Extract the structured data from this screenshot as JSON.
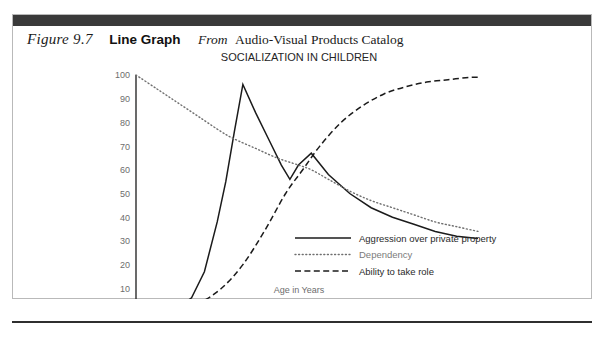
{
  "figure": {
    "number": "Figure 9.7",
    "kind": "Line Graph",
    "from_label": "From",
    "source": "Audio-Visual Products Catalog"
  },
  "chart_data": {
    "type": "line",
    "title": "SOCIALIZATION IN CHILDREN",
    "xlabel": "Age in Years",
    "ylabel": "",
    "xlim": [
      0,
      8
    ],
    "ylim": [
      0,
      100
    ],
    "grid": false,
    "legend_position": "inside-bottom-right",
    "x_ticks": [
      "0",
      "0.5",
      "1",
      "2",
      "3",
      "4",
      "5",
      "6",
      "7",
      "8"
    ],
    "x_tick_values": [
      0,
      0.5,
      1,
      2,
      3,
      4,
      5,
      6,
      7,
      8
    ],
    "y_ticks": [
      "0",
      "10",
      "20",
      "30",
      "40",
      "50",
      "60",
      "70",
      "80",
      "90",
      "100"
    ],
    "y_tick_values": [
      0,
      10,
      20,
      30,
      40,
      50,
      60,
      70,
      80,
      90,
      100
    ],
    "series": [
      {
        "name": "Aggression over private property",
        "style": "solid",
        "color": "#1b1b1b",
        "x": [
          1.0,
          1.3,
          1.6,
          1.9,
          2.1,
          2.3,
          2.5,
          2.8,
          3.1,
          3.4,
          3.6,
          3.8,
          4.1,
          4.5,
          5.0,
          5.5,
          6.0,
          6.5,
          7.0,
          7.5,
          8.0
        ],
        "y": [
          2,
          6,
          17,
          38,
          55,
          76,
          96,
          84,
          73,
          62,
          56,
          62,
          67,
          58,
          50,
          44,
          40,
          37,
          34,
          32,
          31
        ]
      },
      {
        "name": "Dependency",
        "style": "dotted",
        "color": "#6f6f6f",
        "x": [
          0.0,
          0.5,
          1.0,
          1.5,
          2.0,
          2.3,
          2.8,
          3.3,
          3.8,
          4.1,
          4.5,
          5.0,
          5.5,
          6.0,
          6.5,
          7.0,
          7.5,
          8.0
        ],
        "y": [
          100,
          94,
          88,
          82,
          76,
          73,
          69,
          65,
          62,
          60,
          56,
          51,
          47,
          44,
          41,
          38,
          36,
          34
        ]
      },
      {
        "name": "Ability to take role",
        "style": "dashed",
        "color": "#1b1b1b",
        "x": [
          1.0,
          1.5,
          2.0,
          2.5,
          3.0,
          3.5,
          3.9,
          4.3,
          4.8,
          5.3,
          5.8,
          6.3,
          6.8,
          7.3,
          7.8,
          8.0
        ],
        "y": [
          1,
          4,
          10,
          20,
          34,
          50,
          60,
          70,
          80,
          87,
          92,
          95,
          97,
          98,
          99,
          99
        ]
      }
    ]
  }
}
